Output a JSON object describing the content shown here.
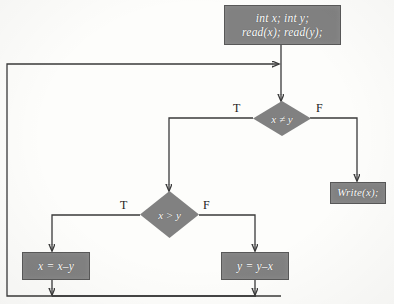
{
  "diagram": {
    "colors": {
      "node_fill": "#818181",
      "node_border": "#585858",
      "node_text": "#ffffff",
      "wire": "#3a3a3a",
      "background": "#fdfdfb"
    },
    "nodes": {
      "declare": {
        "line1": "int x; int y;",
        "line2": "read(x); read(y);"
      },
      "decision_not_equal": {
        "label": "x ≠ y",
        "true_label": "T",
        "false_label": "F"
      },
      "decision_greater": {
        "label": "x > y",
        "true_label": "T",
        "false_label": "F"
      },
      "assign_x": {
        "label": "x = x–y"
      },
      "assign_y": {
        "label": "y = y–x"
      },
      "write": {
        "label": "Write(x);"
      }
    }
  }
}
